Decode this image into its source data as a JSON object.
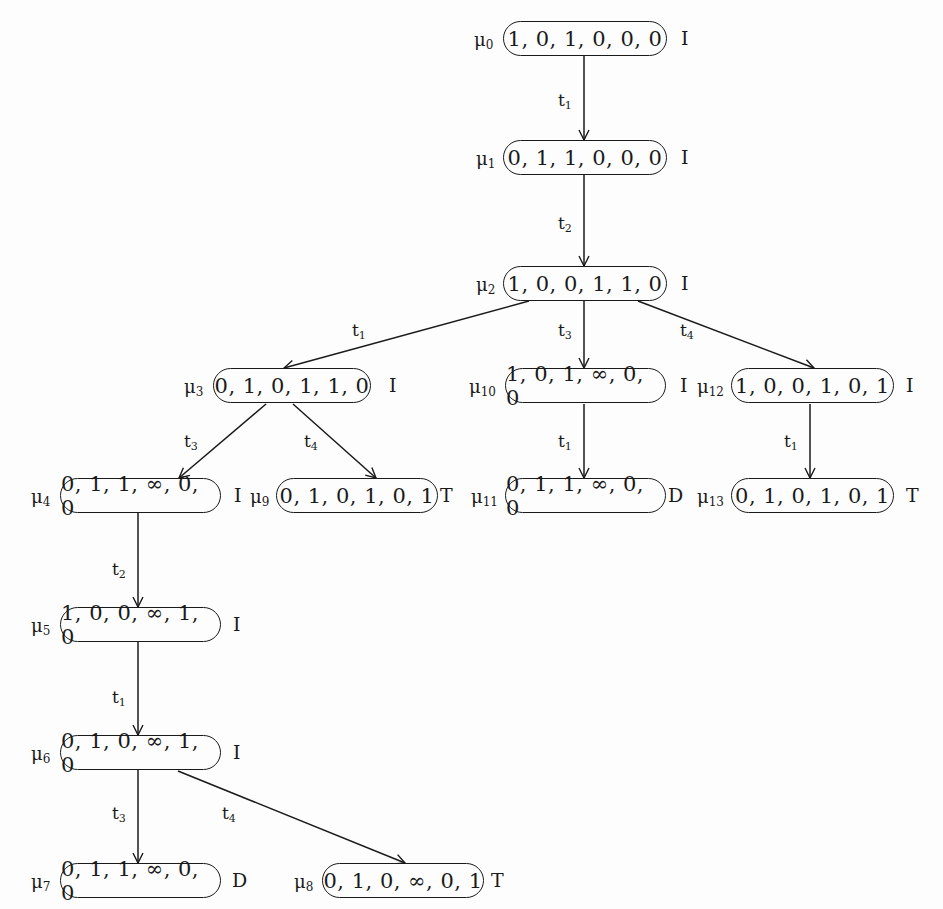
{
  "diagram": {
    "type": "coverability-tree",
    "nodes": [
      {
        "id": "mu0",
        "name": "μ",
        "sub": "0",
        "marking": "1, 0, 1, 0, 0, 0",
        "tag": "I"
      },
      {
        "id": "mu1",
        "name": "μ",
        "sub": "1",
        "marking": "0, 1, 1, 0, 0, 0",
        "tag": "I"
      },
      {
        "id": "mu2",
        "name": "μ",
        "sub": "2",
        "marking": "1, 0, 0, 1, 1, 0",
        "tag": "I"
      },
      {
        "id": "mu3",
        "name": "μ",
        "sub": "3",
        "marking": "0, 1, 0, 1, 1, 0",
        "tag": "I"
      },
      {
        "id": "mu4",
        "name": "μ",
        "sub": "4",
        "marking": "0, 1, 1, ∞, 0, 0",
        "tag": "I"
      },
      {
        "id": "mu5",
        "name": "μ",
        "sub": "5",
        "marking": "1, 0, 0, ∞, 1, 0",
        "tag": "I"
      },
      {
        "id": "mu6",
        "name": "μ",
        "sub": "6",
        "marking": "0, 1, 0, ∞, 1, 0",
        "tag": "I"
      },
      {
        "id": "mu7",
        "name": "μ",
        "sub": "7",
        "marking": "0, 1, 1, ∞, 0, 0",
        "tag": "D"
      },
      {
        "id": "mu8",
        "name": "μ",
        "sub": "8",
        "marking": "0, 1, 0, ∞, 0, 1",
        "tag": "T"
      },
      {
        "id": "mu9",
        "name": "μ",
        "sub": "9",
        "marking": "0, 1, 0, 1, 0, 1",
        "tag": "T"
      },
      {
        "id": "mu10",
        "name": "μ",
        "sub": "10",
        "marking": "1, 0, 1, ∞, 0, 0",
        "tag": "I"
      },
      {
        "id": "mu11",
        "name": "μ",
        "sub": "11",
        "marking": "0, 1, 1, ∞, 0, 0",
        "tag": "D"
      },
      {
        "id": "mu12",
        "name": "μ",
        "sub": "12",
        "marking": "1, 0, 0, 1, 0, 1",
        "tag": "I"
      },
      {
        "id": "mu13",
        "name": "μ",
        "sub": "13",
        "marking": "0, 1, 0, 1, 0, 1",
        "tag": "T"
      }
    ],
    "edges": [
      {
        "from": "mu0",
        "to": "mu1",
        "t": "t",
        "sub": "1"
      },
      {
        "from": "mu1",
        "to": "mu2",
        "t": "t",
        "sub": "2"
      },
      {
        "from": "mu2",
        "to": "mu3",
        "t": "t",
        "sub": "1"
      },
      {
        "from": "mu2",
        "to": "mu10",
        "t": "t",
        "sub": "3"
      },
      {
        "from": "mu2",
        "to": "mu12",
        "t": "t",
        "sub": "4"
      },
      {
        "from": "mu3",
        "to": "mu4",
        "t": "t",
        "sub": "3"
      },
      {
        "from": "mu3",
        "to": "mu9",
        "t": "t",
        "sub": "4"
      },
      {
        "from": "mu10",
        "to": "mu11",
        "t": "t",
        "sub": "1"
      },
      {
        "from": "mu12",
        "to": "mu13",
        "t": "t",
        "sub": "1"
      },
      {
        "from": "mu4",
        "to": "mu5",
        "t": "t",
        "sub": "2"
      },
      {
        "from": "mu5",
        "to": "mu6",
        "t": "t",
        "sub": "1"
      },
      {
        "from": "mu6",
        "to": "mu7",
        "t": "t",
        "sub": "3"
      },
      {
        "from": "mu6",
        "to": "mu8",
        "t": "t",
        "sub": "4"
      }
    ],
    "colors": {
      "line": "#1a1a1a",
      "background": "#fdfdfd"
    }
  }
}
